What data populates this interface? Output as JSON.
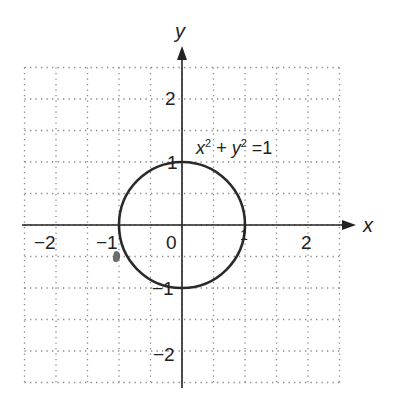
{
  "chart_data": {
    "type": "line",
    "title": "",
    "xlabel": "x",
    "ylabel": "y",
    "xlim": [
      -2.5,
      2.5
    ],
    "ylim": [
      -2.5,
      2.5
    ],
    "grid": true,
    "grid_step": 0.5,
    "x_ticks": [
      "-2",
      "-1",
      "0",
      "1",
      "2"
    ],
    "y_ticks": [
      "2",
      "1",
      "-1",
      "-2"
    ],
    "annotation": "x² + y² = 1",
    "series": [
      {
        "name": "unit circle",
        "equation": "x^2 + y^2 = 1",
        "center": [
          0,
          0
        ],
        "radius": 1
      }
    ]
  },
  "labels": {
    "x_axis": "x",
    "y_axis": "y",
    "x_tick_neg2": "−2",
    "x_tick_neg1": "−1",
    "x_tick_0": "0",
    "x_tick_1": "1",
    "x_tick_2": "2",
    "y_tick_2": "2",
    "y_tick_1": "1",
    "y_tick_neg1": "−1",
    "y_tick_neg2": "−2",
    "eq_x": "x",
    "eq_plus": " + ",
    "eq_y": "y",
    "eq_sup": "2",
    "eq_rhs": " =1"
  },
  "colors": {
    "axis": "#222222",
    "grid": "#888888",
    "curve": "#2a2a2a"
  }
}
